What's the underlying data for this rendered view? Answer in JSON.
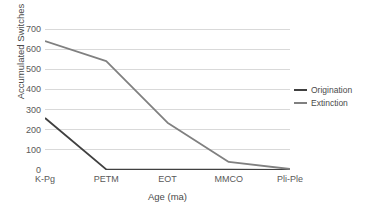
{
  "chart_data": {
    "type": "line",
    "title": "",
    "xlabel": "Age (ma)",
    "ylabel": "Accumulated Switches",
    "categories": [
      "K-Pg",
      "PETM",
      "EOT",
      "MMCO",
      "Pli-Ple"
    ],
    "series": [
      {
        "name": "Origination",
        "color": "#404040",
        "values": [
          258,
          3,
          2,
          2,
          0
        ]
      },
      {
        "name": "Extinction",
        "color": "#808080",
        "values": [
          640,
          540,
          235,
          40,
          5
        ]
      }
    ],
    "ylim": [
      0,
      700
    ],
    "yticks": [
      0,
      100,
      200,
      300,
      400,
      500,
      600,
      700
    ],
    "ytick_labels": [
      "0",
      "100",
      "200",
      "300",
      "400",
      "500",
      "600",
      "700"
    ],
    "grid": true,
    "grid_color": "#d9d9d9",
    "legend_position": "right",
    "background": "#ffffff"
  }
}
